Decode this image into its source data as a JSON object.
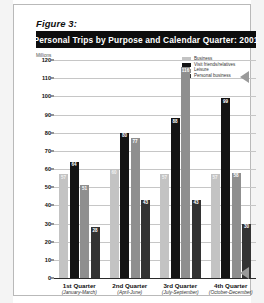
{
  "figure": {
    "label": "Figure 3:",
    "title": "Personal Trips by Purpose and Calendar Quarter: 2001",
    "units": "Millions"
  },
  "legend": {
    "position": "top-right",
    "items": [
      {
        "label": "Business",
        "color": "#c3c3c3"
      },
      {
        "label": "Visit friends/relatives",
        "color": "#141414"
      },
      {
        "label": "Leisure",
        "color": "#8f8f8f"
      },
      {
        "label": "Personal business",
        "color": "#333333"
      }
    ]
  },
  "markers": {
    "arrow_top": "pointer-arrow",
    "arrow_bottom": "pointer-arrow"
  },
  "chart_data": {
    "type": "bar",
    "title": "Personal Trips by Purpose and Calendar Quarter: 2001",
    "xlabel": "",
    "ylabel": "Millions",
    "ylim": [
      0,
      120
    ],
    "ystep": 10,
    "grid": true,
    "yticks": [
      0,
      10,
      20,
      30,
      40,
      50,
      60,
      70,
      80,
      90,
      100,
      110,
      120
    ],
    "categories": [
      "1st Quarter",
      "2nd Quarter",
      "3rd Quarter",
      "4th Quarter"
    ],
    "category_sublabels": [
      "(January-March)",
      "(April-June)",
      "(July-September)",
      "(October-December)"
    ],
    "series": [
      {
        "name": "Business",
        "color": "#c3c3c3",
        "values": [
          57,
          60,
          57,
          57
        ]
      },
      {
        "name": "Visit friends/relatives",
        "color": "#141414",
        "values": [
          64,
          80,
          88,
          99
        ]
      },
      {
        "name": "Leisure",
        "color": "#8f8f8f",
        "values": [
          51,
          77,
          116,
          58
        ]
      },
      {
        "name": "Personal business",
        "color": "#333333",
        "values": [
          28,
          43,
          43,
          30
        ]
      }
    ]
  }
}
